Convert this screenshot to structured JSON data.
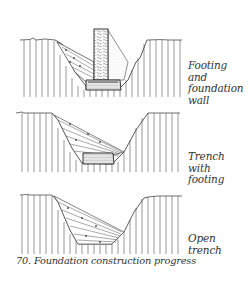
{
  "figure": {
    "caption": "70. Foundation construction progress",
    "stages": [
      {
        "id": "footing-and-wall",
        "label_lines": [
          "Footing",
          "and",
          "foundation",
          "wall"
        ]
      },
      {
        "id": "trench-with-footing",
        "label_lines": [
          "Trench",
          "with",
          "footing"
        ]
      },
      {
        "id": "open-trench",
        "label_lines": [
          "Open",
          "trench"
        ]
      }
    ]
  },
  "colors": {
    "ink": "#333333",
    "background": "#ffffff"
  }
}
